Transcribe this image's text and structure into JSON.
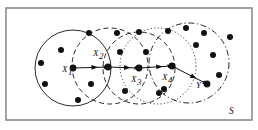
{
  "figure": {
    "region_label": "S",
    "background_color": "#ffffff",
    "stroke_color": "#111111",
    "node_color": "#111111",
    "frame": {
      "x": 6,
      "y": 8,
      "width": 246,
      "height": 112,
      "stroke": "#8c8c8c"
    }
  },
  "labels": {
    "x1": {
      "base": "X",
      "sub": "1",
      "x": 62,
      "y": 72
    },
    "x2": {
      "base": "X",
      "sub": "2",
      "x": 93,
      "y": 56
    },
    "x3": {
      "base": "X",
      "sub": "3",
      "x": 131,
      "y": 82
    },
    "x4": {
      "base": "X",
      "sub": "4",
      "x": 162,
      "y": 80
    },
    "y": {
      "base": "Y",
      "sub": "",
      "x": 196,
      "y": 88
    },
    "s": {
      "base": "S",
      "sub": "",
      "x": 229,
      "y": 114
    }
  },
  "circles": [
    {
      "name": "circle-1-solid",
      "cx": 73,
      "cy": 68,
      "r": 38,
      "style": "solid"
    },
    {
      "name": "circle-2-dashed",
      "cx": 110,
      "cy": 66,
      "r": 38,
      "style": "dashed"
    },
    {
      "name": "circle-3-dashed",
      "cx": 139,
      "cy": 68,
      "r": 36,
      "style": "dashed"
    },
    {
      "name": "circle-4-dotted",
      "cx": 158,
      "cy": 66,
      "r": 38,
      "style": "dotted"
    },
    {
      "name": "circle-5-dashdot",
      "cx": 189,
      "cy": 63,
      "r": 40,
      "style": "dashdot"
    }
  ],
  "path_nodes": [
    {
      "name": "node-x1",
      "x": 73,
      "y": 68
    },
    {
      "name": "node-x2",
      "x": 108,
      "y": 67
    },
    {
      "name": "node-x3",
      "x": 139,
      "y": 68
    },
    {
      "name": "node-x4",
      "x": 172,
      "y": 66
    },
    {
      "name": "node-y",
      "x": 207,
      "y": 84
    }
  ],
  "path_edges": [
    {
      "name": "edge-x1-x2",
      "x1": 73,
      "y1": 68,
      "x2": 108,
      "y2": 67
    },
    {
      "name": "edge-x2-x3",
      "x1": 108,
      "y1": 67,
      "x2": 139,
      "y2": 68
    },
    {
      "name": "edge-x3-x4",
      "x1": 139,
      "y1": 68,
      "x2": 172,
      "y2": 66
    },
    {
      "name": "edge-x4-y",
      "x1": 172,
      "y1": 66,
      "x2": 207,
      "y2": 84
    }
  ],
  "scatter_points": [
    {
      "x": 61,
      "y": 50
    },
    {
      "x": 41,
      "y": 63
    },
    {
      "x": 45,
      "y": 84
    },
    {
      "x": 78,
      "y": 100
    },
    {
      "x": 91,
      "y": 84
    },
    {
      "x": 89,
      "y": 33
    },
    {
      "x": 117,
      "y": 33
    },
    {
      "x": 120,
      "y": 52
    },
    {
      "x": 139,
      "y": 32
    },
    {
      "x": 146,
      "y": 52
    },
    {
      "x": 125,
      "y": 91
    },
    {
      "x": 159,
      "y": 93
    },
    {
      "x": 164,
      "y": 89
    },
    {
      "x": 186,
      "y": 28
    },
    {
      "x": 204,
      "y": 33
    },
    {
      "x": 196,
      "y": 45
    },
    {
      "x": 213,
      "y": 55
    },
    {
      "x": 219,
      "y": 75
    },
    {
      "x": 168,
      "y": 31
    },
    {
      "x": 230,
      "y": 37
    }
  ]
}
